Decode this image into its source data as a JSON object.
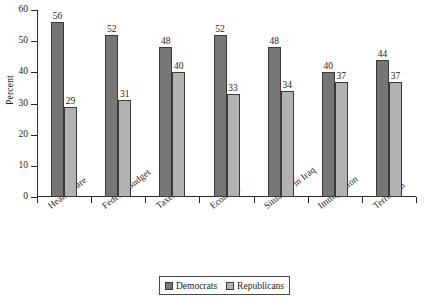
{
  "chart_data": {
    "type": "bar",
    "title": "",
    "xlabel": "",
    "ylabel": "Percent",
    "ylim": [
      0,
      60
    ],
    "yticks": [
      0,
      10,
      20,
      30,
      40,
      50,
      60
    ],
    "ytick_labels": [
      "0",
      "10",
      "20",
      "30",
      "40",
      "50",
      "60"
    ],
    "grid": false,
    "legend_position": "bottom-center",
    "categories": [
      "Health Care",
      "Federal Budget",
      "Taxes",
      "Economy",
      "Situation in Iraq",
      "Immigration",
      "Terrorism"
    ],
    "series": [
      {
        "name": "Democrats",
        "color": "#767676",
        "values": [
          56,
          52,
          48,
          52,
          48,
          40,
          44
        ]
      },
      {
        "name": "Republicans",
        "color": "#b2b2b2",
        "values": [
          29,
          31,
          40,
          33,
          34,
          37,
          37
        ]
      }
    ]
  },
  "legend": {
    "entries": [
      {
        "label": "Democrats"
      },
      {
        "label": "Republicans"
      }
    ]
  }
}
